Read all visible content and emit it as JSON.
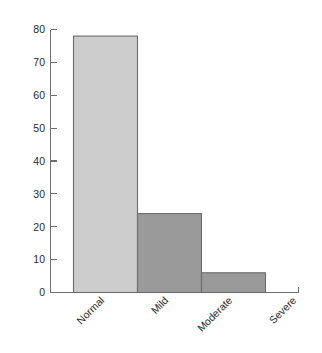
{
  "chart_data": {
    "type": "bar",
    "title": "",
    "subtitle": "",
    "xlabel": "",
    "ylabel": "",
    "categories": [
      "Normal",
      "Mild",
      "Moderate",
      "Severe"
    ],
    "values": [
      78,
      24,
      6,
      0
    ],
    "series": [
      {
        "name": "",
        "values": [
          78,
          24,
          6,
          0
        ]
      }
    ],
    "ylim": [
      0,
      80
    ],
    "xlim": [
      0,
      4
    ],
    "ytick_labels": [
      "0",
      "10",
      "20",
      "30",
      "40",
      "50",
      "60",
      "70",
      "80"
    ],
    "ytick_values": [
      0,
      10,
      20,
      30,
      40,
      50,
      60,
      70,
      80
    ],
    "ytick_step": 10,
    "grid": false,
    "legend": null,
    "legend_position": "none",
    "annotations": [],
    "x_label_rotation_deg": 45,
    "bar_colors": [
      "#cdcdcd",
      "#9a9a9a",
      "#9a9a9a",
      "#9a9a9a"
    ],
    "bar_edge_color": "#6b6b6b",
    "axis_color": "#6e6e6e",
    "background_color": "#ffffff"
  }
}
